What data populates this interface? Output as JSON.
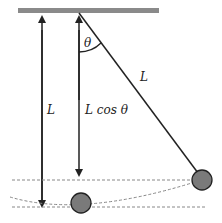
{
  "diagram": {
    "labels": {
      "theta": "θ",
      "string_length": "L",
      "vertical_length": "L",
      "cos_label": "L cos θ"
    },
    "colors": {
      "ceiling": "#8a8a8a",
      "bob": "#7a7a7a",
      "line": "#222222",
      "dashed": "#888888"
    }
  }
}
